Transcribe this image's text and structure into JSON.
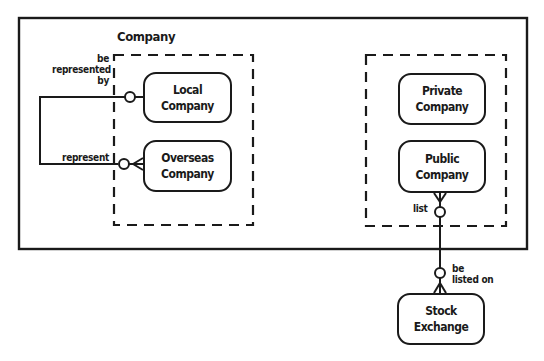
{
  "diagram": {
    "supertype": {
      "label": "Company"
    },
    "groups": [
      {
        "name": "left-subtype-group",
        "entities": [
          {
            "id": "local",
            "line1": "Local",
            "line2": "Company"
          },
          {
            "id": "overseas",
            "line1": "Overseas",
            "line2": "Company"
          }
        ]
      },
      {
        "name": "right-subtype-group",
        "entities": [
          {
            "id": "private",
            "line1": "Private",
            "line2": "Company"
          },
          {
            "id": "public",
            "line1": "Public",
            "line2": "Company"
          }
        ]
      }
    ],
    "external_entities": [
      {
        "id": "stock",
        "line1": "Stock",
        "line2": "Exchange"
      }
    ],
    "relationships": [
      {
        "from": "local",
        "to": "overseas",
        "from_label": [
          "be",
          "represented",
          "by"
        ],
        "to_label": "represent",
        "from_cardinality": "zero-or-one",
        "to_cardinality": "zero-or-many"
      },
      {
        "from": "public",
        "to": "stock",
        "from_label": "list",
        "to_label": [
          "be",
          "listed on"
        ],
        "from_cardinality": "zero-or-many",
        "to_cardinality": "zero-or-many"
      }
    ]
  }
}
